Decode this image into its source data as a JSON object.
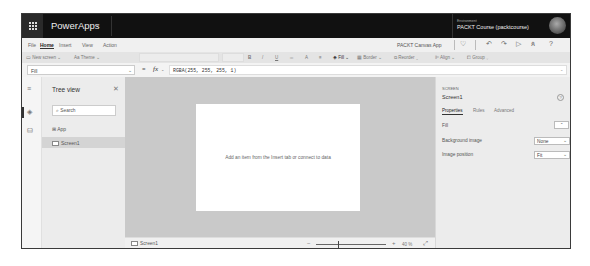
{
  "topbar": {
    "app_name": "PowerApps",
    "environment_label": "Environment",
    "environment_name": "PACKT Course (packtcourse)"
  },
  "menu": {
    "tabs": [
      "File",
      "Home",
      "Insert",
      "View",
      "Action"
    ],
    "active_tab": "Home",
    "app_title": "PACKT Canvas App",
    "icons": [
      "stethoscope-icon",
      "undo-icon",
      "redo-icon",
      "play-icon",
      "user-share-icon",
      "help-icon"
    ]
  },
  "ribbon": {
    "new_screen": "New screen",
    "theme": "Theme",
    "bold": "B",
    "italic": "/",
    "underline": "U",
    "align_text": "≡",
    "font_color": "A",
    "fill": "Fill",
    "border": "Border",
    "reorder": "Reorder",
    "align": "Align",
    "group": "Group"
  },
  "formula_bar": {
    "property": "Fill",
    "equals": "=",
    "fx": "fx",
    "formula": "RGBA(255, 255, 255, 1)"
  },
  "tree_view": {
    "title": "Tree view",
    "search_placeholder": "Search",
    "items": [
      {
        "label": "App",
        "selected": false
      },
      {
        "label": "Screen1",
        "selected": true
      }
    ]
  },
  "canvas": {
    "message": "Add an item from the Insert tab or connect to data",
    "status_screen": "Screen1",
    "zoom_value": "40 %"
  },
  "properties": {
    "kind": "SCREEN",
    "name": "Screen1",
    "tabs": [
      "Properties",
      "Rules",
      "Advanced"
    ],
    "active_tab": "Properties",
    "fill_label": "Fill",
    "background_image_label": "Background image",
    "background_image_value": "None",
    "image_position_label": "Image position",
    "image_position_value": "Fit"
  },
  "colors": {
    "topbar_bg": "#111111",
    "canvas_bg": "#c9c9c9",
    "screen_bg": "#ffffff"
  }
}
